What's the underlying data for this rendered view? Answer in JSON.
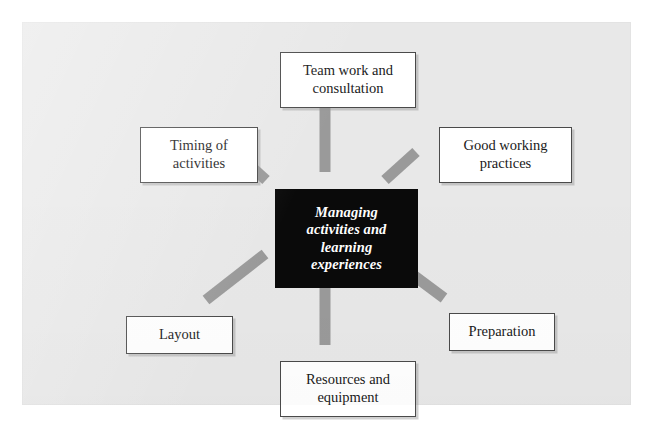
{
  "diagram": {
    "title": "Managing activities and learning experiences",
    "type": "spoke-hub-diagram",
    "colors": {
      "panel_background": "#e8e8e8",
      "center_box_background": "#0a0a0a",
      "center_box_text": "#ffffff",
      "node_background": "#ffffff",
      "node_border": "#4a4a4a",
      "connector": "#9a9a9a"
    },
    "center": {
      "label": "Managing activities and learning experiences",
      "line1": "Managing",
      "line2": "activities and",
      "line3": "learning",
      "line4": "experiences"
    },
    "nodes": [
      {
        "id": "team-work-and-consultation",
        "label": "Team work and consultation",
        "position": "top"
      },
      {
        "id": "timing-of-activities",
        "label": "Timing of activities",
        "position": "top-left"
      },
      {
        "id": "good-working-practices",
        "label": "Good working practices",
        "position": "top-right"
      },
      {
        "id": "layout",
        "label": "Layout",
        "position": "bottom-left"
      },
      {
        "id": "preparation",
        "label": "Preparation",
        "position": "bottom-right"
      },
      {
        "id": "resources-and-equipment",
        "label": "Resources and equipment",
        "position": "bottom"
      }
    ]
  }
}
